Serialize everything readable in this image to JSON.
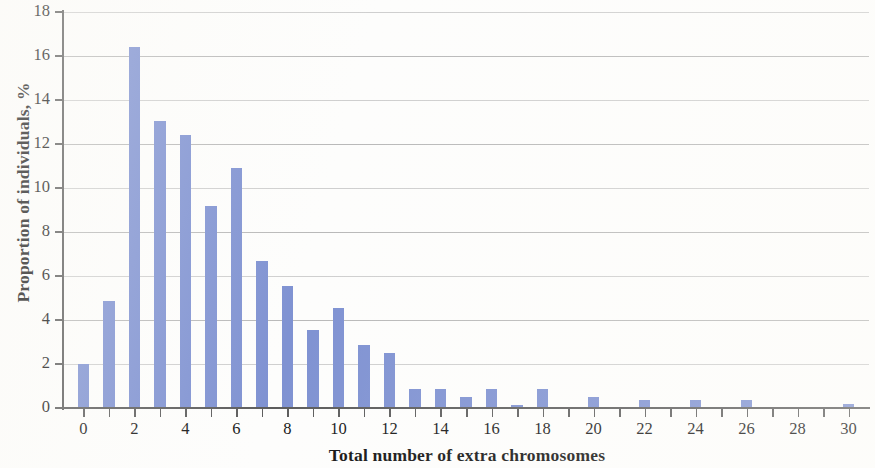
{
  "chart_data": {
    "type": "bar",
    "title": "",
    "subtitle": "",
    "xlabel": "Total number of extra chromosomes",
    "ylabel": "Proportion of individuals, %",
    "xlim": [
      -0.8,
      30.8
    ],
    "ylim": [
      0,
      18
    ],
    "y_tick_step": 2,
    "x_tick_step": 1,
    "x_label_step": 2,
    "grid": "horizontal",
    "legend": "none",
    "bar_color": "#7f92d2",
    "axis_color": "#5d5d5d",
    "gridline_color": "#b9b9b9",
    "categories": [
      0,
      1,
      2,
      3,
      4,
      5,
      6,
      7,
      8,
      9,
      10,
      11,
      12,
      13,
      14,
      15,
      16,
      17,
      18,
      19,
      20,
      21,
      22,
      23,
      24,
      25,
      26,
      27,
      28,
      29,
      30
    ],
    "values": [
      2.0,
      4.85,
      16.4,
      13.05,
      12.4,
      9.2,
      10.9,
      6.7,
      5.55,
      3.55,
      4.55,
      2.85,
      2.5,
      0.85,
      0.85,
      0.5,
      0.85,
      0.15,
      0.85,
      0.0,
      0.5,
      0.0,
      0.35,
      0.0,
      0.35,
      0.0,
      0.35,
      0.0,
      0.0,
      0.0,
      0.2
    ],
    "y_ticks": [
      0,
      2,
      4,
      6,
      8,
      10,
      12,
      14,
      16,
      18
    ],
    "y_tick_labels": [
      "0",
      "2",
      "4",
      "6",
      "8",
      "10",
      "12",
      "14",
      "16",
      "18"
    ],
    "x_tick_labels": [
      "0",
      "",
      "2",
      "",
      "4",
      "",
      "6",
      "",
      "8",
      "",
      "10",
      "",
      "12",
      "",
      "14",
      "",
      "16",
      "",
      "18",
      "",
      "20",
      "",
      "22",
      "",
      "24",
      "",
      "26",
      "",
      "28",
      "",
      "30"
    ]
  }
}
